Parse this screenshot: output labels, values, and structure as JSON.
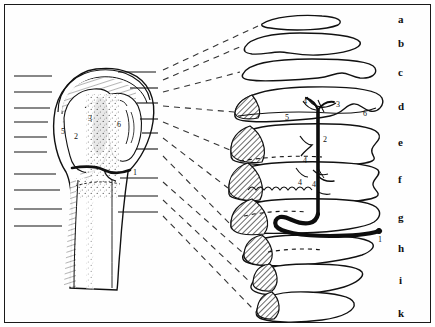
{
  "figure": {
    "background_color": "#ffffff",
    "border_color": "#1a1a1a",
    "ink_color": "#111111",
    "width": 435,
    "height": 327
  },
  "slices": {
    "labels": [
      {
        "id": "a",
        "text": "a",
        "x": 398,
        "y": 14
      },
      {
        "id": "b",
        "text": "b",
        "x": 398,
        "y": 38
      },
      {
        "id": "c",
        "text": "c",
        "x": 398,
        "y": 67
      },
      {
        "id": "d",
        "text": "d",
        "x": 398,
        "y": 101
      },
      {
        "id": "e",
        "text": "e",
        "x": 398,
        "y": 137
      },
      {
        "id": "f",
        "text": "f",
        "x": 398,
        "y": 174
      },
      {
        "id": "g",
        "text": "g",
        "x": 398,
        "y": 212
      },
      {
        "id": "h",
        "text": "h",
        "x": 398,
        "y": 243
      },
      {
        "id": "i",
        "text": "i",
        "x": 399,
        "y": 275
      },
      {
        "id": "k",
        "text": "k",
        "x": 398,
        "y": 308
      }
    ]
  },
  "bone_numbers": [
    {
      "id": "bone-5",
      "text": "5",
      "x": 61,
      "y": 128
    },
    {
      "id": "bone-3",
      "text": "3",
      "x": 88,
      "y": 115
    },
    {
      "id": "bone-6",
      "text": "6",
      "x": 117,
      "y": 121
    },
    {
      "id": "bone-2",
      "text": "2",
      "x": 74,
      "y": 133
    },
    {
      "id": "bone-1",
      "text": "1",
      "x": 133,
      "y": 169
    }
  ],
  "section_numbers": [
    {
      "id": "sec-d-4",
      "text": "4",
      "x": 303,
      "y": 104
    },
    {
      "id": "sec-d-3",
      "text": "3",
      "x": 336,
      "y": 107
    },
    {
      "id": "sec-d-5",
      "text": "5",
      "x": 285,
      "y": 116
    },
    {
      "id": "sec-d-6",
      "text": "6",
      "x": 363,
      "y": 114
    },
    {
      "id": "sec-e-2",
      "text": "2",
      "x": 332,
      "y": 139
    },
    {
      "id": "sec-e-4",
      "text": "4",
      "x": 307,
      "y": 149
    },
    {
      "id": "sec-f-4a",
      "text": "4",
      "x": 300,
      "y": 176
    },
    {
      "id": "sec-f-4b",
      "text": "4",
      "x": 316,
      "y": 178
    },
    {
      "id": "sec-g-1",
      "text": "1",
      "x": 381,
      "y": 235
    }
  ],
  "legend_keys": {
    "1": "nutrient / circumflex vessel (thick black)",
    "2": "intraosseous vascular channel",
    "3": "branching epiphyseal vessel",
    "4": "metaphyseal vessel branch",
    "5": "greater tuberosity region",
    "6": "lesser tuberosity region"
  },
  "left_ticks": {
    "count": 10,
    "x_start": 14,
    "x_end": 52,
    "ys": [
      76,
      92,
      108,
      122,
      137,
      152,
      174,
      190,
      209,
      226
    ]
  },
  "right_ticks": {
    "count": 9,
    "x_start": 118,
    "x_end": 158,
    "ys": [
      72,
      88,
      103,
      119,
      133,
      149,
      178,
      196,
      212
    ]
  },
  "leader_lines": {
    "style": "dashed",
    "count": 10
  },
  "section_outlines": [
    {
      "id": "a",
      "cy": 22,
      "path": "M262,24 C272,17 300,14 322,16 C338,17 344,21 338,25 C326,30 296,31 278,29 C268,28 260,27 262,24 Z",
      "hatch": null
    },
    {
      "id": "b",
      "cy": 44,
      "path": "M245,47 C250,38 272,33 300,33 C330,33 356,36 360,42 C363,48 344,54 318,55 C300,56 288,52 280,52 C270,52 262,55 252,54 C245,53 243,51 245,47 Z",
      "hatch": null
    },
    {
      "id": "c",
      "cy": 71,
      "path": "M243,74 C248,63 276,59 312,59 C348,59 372,62 375,68 C378,74 371,79 360,78 C352,77 348,73 342,73 C334,73 330,77 318,78 C298,80 262,82 250,80 C243,79 241,77 243,74 Z",
      "hatch": null
    },
    {
      "id": "d",
      "cy": 104,
      "path": "M235,113 C237,96 264,88 308,87 C352,86 378,90 382,98 C385,105 378,113 370,111 C362,109 360,103 353,104 C345,105 344,113 330,116 C310,120 262,123 246,121 C236,120 234,118 235,113 Z",
      "hatch": {
        "d": "M235,113 C236,104 242,99 252,95 C258,102 262,112 258,118 C248,120 236,119 235,113 Z"
      }
    },
    {
      "id": "e",
      "cy": 140,
      "path": "M231,152 C230,132 252,125 300,124 C344,123 372,126 378,133 C383,139 374,143 372,149 C370,155 378,158 372,161 C364,165 330,167 296,166 C262,165 238,164 233,160 C230,157 231,155 231,152 Z",
      "hatch": {
        "d": "M231,152 C230,139 238,130 250,126 C262,134 268,150 262,162 C246,164 232,160 231,152 Z"
      }
    },
    {
      "id": "f",
      "cy": 178,
      "path": "M229,190 C228,170 248,163 296,162 C340,161 372,164 378,170 C382,175 372,179 373,185 C374,191 382,193 376,197 C366,202 320,204 286,203 C252,202 234,200 230,196 C228,194 229,192 229,190 Z",
      "hatch": {
        "d": "M229,190 C228,176 236,167 248,163 C260,172 266,188 260,200 C244,202 230,198 229,190 Z"
      }
    },
    {
      "id": "g",
      "cy": 214,
      "path": "M231,226 C230,207 250,200 294,199 C338,198 368,201 376,207 C382,212 380,218 374,222 C366,227 340,232 300,233 C264,234 240,233 234,230 C231,228 231,228 231,226 Z",
      "hatch": {
        "d": "M231,226 C230,212 239,203 252,199 C266,208 272,224 264,234 C246,236 232,234 231,226 Z"
      }
    },
    {
      "id": "h",
      "cy": 247,
      "path": "M244,254 C246,239 268,235 306,235 C342,235 366,238 372,243 C376,247 370,252 362,255 C350,259 310,266 282,266 C258,266 244,263 243,259 C242,256 243,255 244,254 Z",
      "hatch": {
        "d": "M244,254 C245,243 252,237 262,235 C272,243 276,257 268,265 C252,266 243,261 244,254 Z"
      }
    },
    {
      "id": "i",
      "cy": 279,
      "path": "M253,282 C256,268 276,264 308,264 C338,264 358,267 362,272 C365,277 356,283 344,287 C328,292 292,296 272,295 C256,294 250,290 251,286 C252,284 252,283 253,282 Z",
      "hatch": {
        "d": "M253,282 C254,271 260,265 270,264 C278,271 280,284 272,291 C260,292 252,288 253,282 Z"
      }
    },
    {
      "id": "k",
      "cy": 310,
      "path": "M257,310 C260,295 280,291 308,292 C336,293 352,297 354,303 C356,310 344,317 322,320 C300,323 274,323 262,319 C256,317 255,313 257,310 Z",
      "hatch": {
        "d": "M257,310 C258,300 263,294 272,292 C280,299 282,312 274,319 C263,320 256,316 257,310 Z"
      }
    }
  ]
}
